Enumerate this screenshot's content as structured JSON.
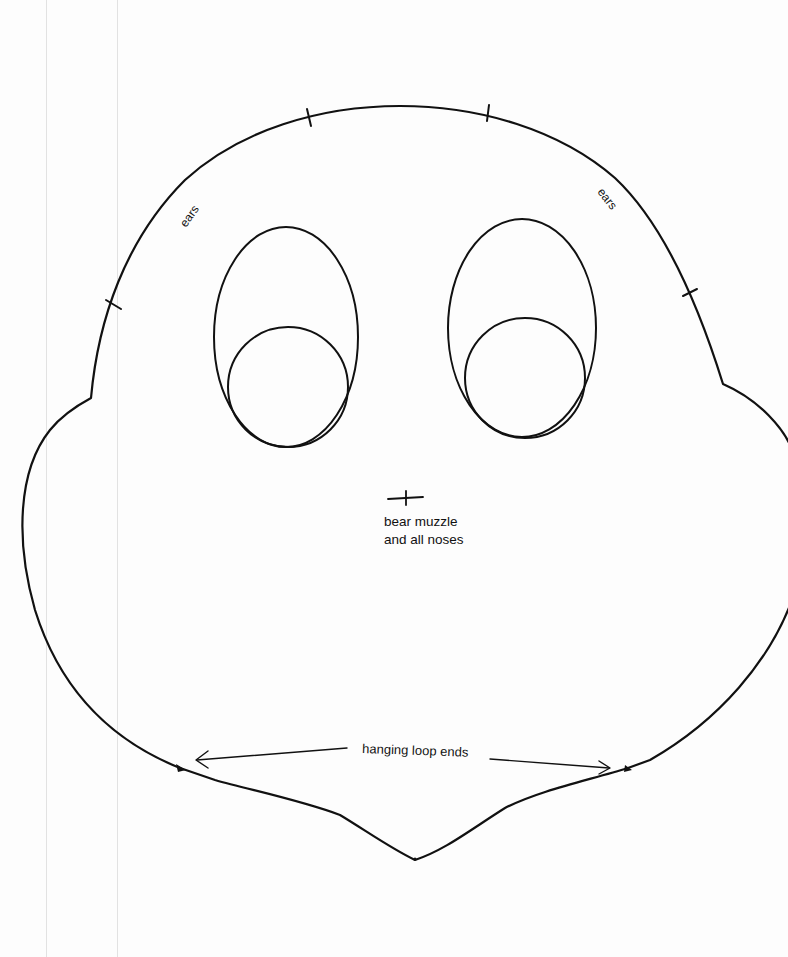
{
  "document": {
    "type": "sewing pattern piece",
    "shape": "bear head outline",
    "background_color": "#ffffff",
    "ink_color": "#111111",
    "margin_line_color": "#e2e2e2"
  },
  "margin_lines": [
    {
      "x": 46
    },
    {
      "x": 117
    }
  ],
  "labels": {
    "ears_left": "ears",
    "ears_right": "ears",
    "muzzle_line1": "bear muzzle",
    "muzzle_line2": "and all noses",
    "hanging_loop": "hanging loop ends"
  },
  "markings": {
    "ear_ticks": [
      {
        "x": 113,
        "y": 305
      },
      {
        "x": 309,
        "y": 118
      },
      {
        "x": 488,
        "y": 113
      },
      {
        "x": 690,
        "y": 292
      }
    ],
    "muzzle_cross": {
      "x": 405,
      "y": 497
    },
    "loop_end_points": [
      {
        "x": 180,
        "y": 768
      },
      {
        "x": 628,
        "y": 768
      }
    ],
    "chin_point": {
      "x": 415,
      "y": 860
    }
  },
  "eyes": {
    "left": {
      "outer_ellipse": {
        "cx": 286,
        "cy": 337,
        "rx": 72,
        "ry": 110
      },
      "inner_circle": {
        "cx": 288,
        "cy": 387,
        "r": 60
      }
    },
    "right": {
      "outer_ellipse": {
        "cx": 522,
        "cy": 328,
        "rx": 74,
        "ry": 109
      },
      "inner_circle": {
        "cx": 525,
        "cy": 378,
        "r": 60
      }
    }
  }
}
